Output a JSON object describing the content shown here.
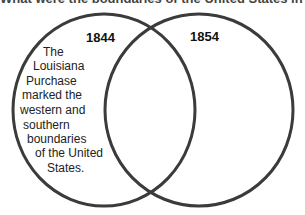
{
  "title": "What were the boundaries of the United States in 1844 and 1854?",
  "venn": {
    "stroke_color": "#3a3a3a",
    "left": {
      "label": "1844"
    },
    "right": {
      "label": "1854"
    }
  },
  "left_text_lines": [
    "The",
    "Louisiana",
    "Purchase",
    "marked the",
    "western and",
    "southern",
    "boundaries",
    "of the United",
    "States."
  ]
}
